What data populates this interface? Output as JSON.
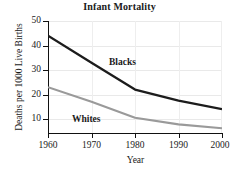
{
  "chart_data": {
    "type": "line",
    "title": "Infant Mortality",
    "xlabel": "Year",
    "ylabel": "Deaths per 1000 Live Births",
    "x": [
      1960,
      1970,
      1980,
      1990,
      2000
    ],
    "xtick_labels": [
      "1960",
      "1970",
      "1980",
      "1990",
      "2000"
    ],
    "ytick_labels": [
      "50",
      "40",
      "30",
      "20",
      "10"
    ],
    "ytick_values": [
      50,
      40,
      30,
      20,
      10
    ],
    "xlim": [
      1960,
      2000
    ],
    "ylim": [
      3,
      52
    ],
    "grid": true,
    "legend_position": "inline-annotations",
    "series": [
      {
        "name": "Blacks",
        "label": "Blacks",
        "color": "#1c1c1c",
        "values": [
          44,
          33,
          22,
          17.5,
          14
        ]
      },
      {
        "name": "Whites",
        "label": "Whites",
        "color": "#9a9a9a",
        "values": [
          23,
          17,
          10.5,
          7.8,
          6.2
        ]
      }
    ]
  }
}
